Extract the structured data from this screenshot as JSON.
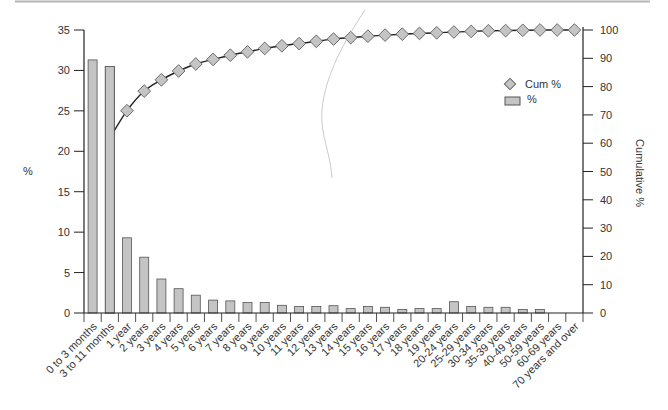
{
  "chart_data": {
    "type": "bar+line",
    "title": "",
    "xlabel": "",
    "ylabel": "%",
    "y2label": "Cumulative %",
    "ylim": [
      0,
      35
    ],
    "y2lim": [
      0,
      100
    ],
    "yticks": [
      0,
      5,
      10,
      15,
      20,
      25,
      30,
      35
    ],
    "y2ticks": [
      0,
      10,
      20,
      30,
      40,
      50,
      60,
      70,
      80,
      90,
      100
    ],
    "grid": false,
    "legend_position": "upper right (inside)",
    "legend": [
      {
        "label": "Cum %",
        "marker": "diamond"
      },
      {
        "label": "%",
        "marker": "bar"
      }
    ],
    "categories": [
      "0 to 3 months",
      "3 to 11 months",
      "1 year",
      "2 years",
      "3 years",
      "4 years",
      "5 years",
      "6 years",
      "7 years",
      "8 years",
      "9 years",
      "10 years",
      "11 years",
      "12 years",
      "13 years",
      "14 years",
      "15 years",
      "16 years",
      "17 years",
      "18 years",
      "19 years",
      "20-24 years",
      "25-29 years",
      "30-34 years",
      "35-39 years",
      "40-49 years",
      "50-59 years",
      "60-69 years",
      "70 years and over"
    ],
    "series": [
      {
        "name": "%",
        "type": "bar",
        "axis": "left",
        "values": [
          31.3,
          30.5,
          9.3,
          6.9,
          4.2,
          3.0,
          2.2,
          1.6,
          1.5,
          1.3,
          1.3,
          0.95,
          0.8,
          0.8,
          0.9,
          0.55,
          0.8,
          0.7,
          0.45,
          0.55,
          0.55,
          1.4,
          0.8,
          0.7,
          0.7,
          0.45,
          0.45,
          0.0,
          0.0
        ]
      },
      {
        "name": "Cum %",
        "type": "line",
        "axis": "right",
        "values": [
          31.3,
          61.8,
          71.5,
          78.4,
          82.4,
          85.5,
          88.0,
          89.6,
          91.1,
          92.3,
          93.5,
          94.4,
          95.2,
          96.0,
          96.8,
          97.3,
          97.8,
          98.2,
          98.5,
          98.8,
          99.0,
          99.3,
          99.5,
          99.7,
          99.8,
          99.9,
          100.0,
          100.0,
          100.0
        ],
        "visible_markers_from_index": 2
      }
    ],
    "colors": {
      "bar_fill": "#c4c4c4",
      "bar_stroke": "#555555",
      "marker_fill": "#c4c4c4",
      "marker_stroke": "#666666",
      "line": "#222222",
      "axis": "#222222",
      "top_rule": "#b5b5b5"
    }
  }
}
